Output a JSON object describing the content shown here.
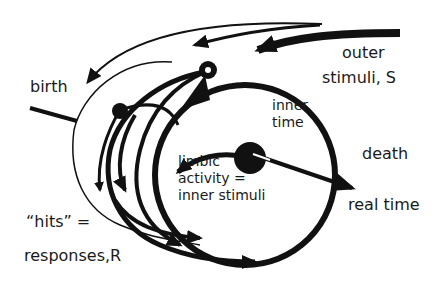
{
  "diagram": {
    "colors": {
      "ink": "#111111",
      "background": "#ffffff"
    },
    "labels": {
      "birth": "birth",
      "outer_stimuli_line1": "outer",
      "outer_stimuli_line2": "stimuli, S",
      "inner_time_line1": "inner",
      "inner_time_line2": "time",
      "limbic_line1": "limbic",
      "limbic_line2": "activity =",
      "limbic_line3": "inner stimuli",
      "death": "death",
      "real_time": "real time",
      "hits_line1": "“hits” =",
      "hits_line2": "responses,R"
    },
    "nodes": [
      "birth",
      "outer stimuli S",
      "inner time",
      "limbic activity = inner stimuli",
      "death",
      "real time",
      "hits = responses R"
    ]
  }
}
